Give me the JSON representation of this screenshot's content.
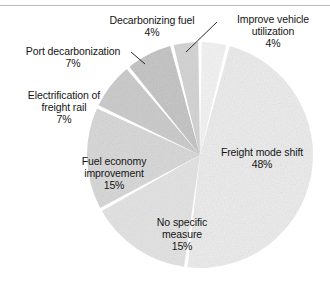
{
  "figure": {
    "background_color": "#ffffff",
    "rule_color": "#b9bcc0"
  },
  "chart_data": {
    "type": "pie",
    "title": "",
    "subtitle": "",
    "xlabel": "",
    "ylabel": "",
    "grid": false,
    "legend_position": "none",
    "label_format": "name-and-percent",
    "start_angle_deg": 0,
    "direction": "clockwise",
    "center": [
      200,
      155
    ],
    "radius": 113,
    "categories": [
      "Improve vehicle utilization",
      "Freight mode shift",
      "No specific measure",
      "Fuel economy improvement",
      "Electrification of freight rail",
      "Port decarbonization",
      "Decarbonizing fuel"
    ],
    "values": [
      4,
      48,
      15,
      15,
      7,
      7,
      4
    ],
    "unit": "%",
    "total": 100,
    "slices": [
      {
        "name": "Improve vehicle utilization",
        "label": "Improve vehicle utilization",
        "value": 4,
        "percent_label": "4%",
        "color": "#f2f2f2",
        "start_deg": 0,
        "end_deg": 14.4,
        "leader_line": true
      },
      {
        "name": "Freight mode shift",
        "label": "Freight mode shift",
        "value": 48,
        "percent_label": "48%",
        "color": "#ececec",
        "start_deg": 14.4,
        "end_deg": 187.2,
        "leader_line": false
      },
      {
        "name": "No specific measure",
        "label": "No specific measure",
        "value": 15,
        "percent_label": "15%",
        "color": "#e2e2e2",
        "start_deg": 187.2,
        "end_deg": 241.2,
        "leader_line": false
      },
      {
        "name": "Fuel economy improvement",
        "label": "Fuel economy improvement",
        "value": 15,
        "percent_label": "15%",
        "color": "#d7d7d7",
        "start_deg": 241.2,
        "end_deg": 295.2,
        "leader_line": false
      },
      {
        "name": "Electrification of freight rail",
        "label": "Electrification of freight rail",
        "value": 7,
        "percent_label": "7%",
        "color": "#c9c9c9",
        "start_deg": 295.2,
        "end_deg": 320.4,
        "leader_line": false
      },
      {
        "name": "Port decarbonization",
        "label": "Port decarbonization",
        "value": 7,
        "percent_label": "7%",
        "color": "#c2c2c2",
        "start_deg": 320.4,
        "end_deg": 345.6,
        "leader_line": true
      },
      {
        "name": "Decarbonizing fuel",
        "label": "Decarbonizing fuel",
        "value": 4,
        "percent_label": "4%",
        "color": "#d2d2d2",
        "start_deg": 345.6,
        "end_deg": 360,
        "leader_line": false
      }
    ]
  },
  "labels": {
    "decarbonizing_fuel": {
      "name": "Decarbonizing fuel",
      "pct": "4%"
    },
    "improve_vehicle_utilization": {
      "name": "Improve vehicle",
      "name2": "utilization",
      "pct": "4%"
    },
    "port_decarbonization": {
      "name": "Port decarbonization",
      "pct": "7%"
    },
    "electrification_freight_rail": {
      "name": "Electrification of",
      "name2": "freight rail",
      "pct": "7%"
    },
    "fuel_economy_improvement": {
      "name": "Fuel economy",
      "name2": "improvement",
      "pct": "15%"
    },
    "no_specific_measure": {
      "name": "No specific",
      "name2": "measure",
      "pct": "15%"
    },
    "freight_mode_shift": {
      "name": "Freight mode shift",
      "pct": "48%"
    }
  }
}
